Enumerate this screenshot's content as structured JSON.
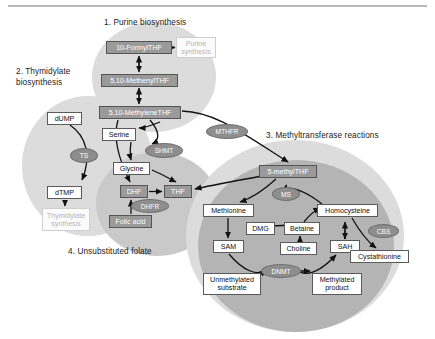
{
  "figure": {
    "sections": [
      {
        "id": "purine",
        "label": "1. Purine biosynthesis",
        "x": 104,
        "y": 18,
        "w": 130
      },
      {
        "id": "thymidylate",
        "label": "2. Thymidylate\nbiosynthesis",
        "x": 16,
        "y": 67,
        "w": 86
      },
      {
        "id": "methyltransferase",
        "label": "3. Methyltransferase reactions",
        "x": 266,
        "y": 131,
        "w": 150
      },
      {
        "id": "unsubstituted",
        "label": "4. Unsubstituted folate",
        "x": 68,
        "y": 247,
        "w": 130
      }
    ],
    "metabolites": [
      {
        "id": "formylthf",
        "label": "10-FormylTHF",
        "style": "gray",
        "x": 106,
        "y": 41,
        "w": 66,
        "h": 13
      },
      {
        "id": "purine-synthesis",
        "label": "Purine\nsynthesis",
        "style": "faded",
        "x": 176,
        "y": 37,
        "w": 40,
        "h": 21
      },
      {
        "id": "methenylthf",
        "label": "5,10-MethenylTHF",
        "style": "gray",
        "x": 101,
        "y": 74,
        "w": 77,
        "h": 13
      },
      {
        "id": "methylenethf",
        "label": "5,10-MethyleneTHF",
        "style": "gray",
        "x": 99,
        "y": 106,
        "w": 82,
        "h": 13
      },
      {
        "id": "dump",
        "label": "dUMP",
        "style": "white",
        "x": 47,
        "y": 112,
        "w": 35,
        "h": 13
      },
      {
        "id": "serine",
        "label": "Serine",
        "style": "white",
        "x": 102,
        "y": 128,
        "w": 34,
        "h": 13
      },
      {
        "id": "glycine",
        "label": "Glycine",
        "style": "white",
        "x": 113,
        "y": 162,
        "w": 37,
        "h": 13
      },
      {
        "id": "dtmp",
        "label": "dTMP",
        "style": "white",
        "x": 47,
        "y": 186,
        "w": 35,
        "h": 13
      },
      {
        "id": "thymidylate-synthesis",
        "label": "Thymidylate\nsynthesis",
        "style": "faded",
        "x": 42,
        "y": 208,
        "w": 48,
        "h": 23
      },
      {
        "id": "dhf",
        "label": "DHF",
        "style": "gray",
        "x": 120,
        "y": 185,
        "w": 28,
        "h": 13
      },
      {
        "id": "thf",
        "label": "THF",
        "style": "gray",
        "x": 164,
        "y": 185,
        "w": 28,
        "h": 13
      },
      {
        "id": "folic-acid",
        "label": "Folic acid",
        "style": "gray",
        "x": 109,
        "y": 215,
        "w": 43,
        "h": 13
      },
      {
        "id": "methylthf",
        "label": "5-methylTHF",
        "style": "gray",
        "x": 259,
        "y": 165,
        "w": 58,
        "h": 13
      },
      {
        "id": "methionine",
        "label": "Methionine",
        "style": "white",
        "x": 203,
        "y": 204,
        "w": 51,
        "h": 13
      },
      {
        "id": "homocysteine",
        "label": "Homocysteine",
        "style": "white",
        "x": 317,
        "y": 204,
        "w": 61,
        "h": 13
      },
      {
        "id": "dmg",
        "label": "DMG",
        "style": "white",
        "x": 246,
        "y": 222,
        "w": 29,
        "h": 13
      },
      {
        "id": "betaine",
        "label": "Betaine",
        "style": "white",
        "x": 284,
        "y": 222,
        "w": 36,
        "h": 13
      },
      {
        "id": "sam",
        "label": "SAM",
        "style": "white",
        "x": 213,
        "y": 240,
        "w": 31,
        "h": 13
      },
      {
        "id": "choline",
        "label": "Choline",
        "style": "white",
        "x": 280,
        "y": 242,
        "w": 37,
        "h": 13
      },
      {
        "id": "sah",
        "label": "SAH",
        "style": "white",
        "x": 330,
        "y": 240,
        "w": 30,
        "h": 13
      },
      {
        "id": "cystathionine",
        "label": "Cystathionine",
        "style": "white",
        "x": 350,
        "y": 250,
        "w": 59,
        "h": 13
      },
      {
        "id": "unmethylated",
        "label": "Unmethylated\nsubstrate",
        "style": "white",
        "x": 203,
        "y": 273,
        "w": 58,
        "h": 22
      },
      {
        "id": "methylated",
        "label": "Methylated\nproduct",
        "style": "white",
        "x": 312,
        "y": 273,
        "w": 50,
        "h": 22
      }
    ],
    "enzymes": [
      {
        "id": "ts",
        "label": "TS",
        "x": 70,
        "y": 148,
        "w": 28,
        "h": 15
      },
      {
        "id": "shmt",
        "label": "SHMT",
        "x": 145,
        "y": 143,
        "w": 38,
        "h": 15
      },
      {
        "id": "dhfr",
        "label": "DHFR",
        "x": 131,
        "y": 199,
        "w": 38,
        "h": 14
      },
      {
        "id": "mthfr",
        "label": "MTHFR",
        "x": 206,
        "y": 124,
        "w": 42,
        "h": 15
      },
      {
        "id": "ms",
        "label": "MS",
        "x": 272,
        "y": 187,
        "w": 28,
        "h": 14
      },
      {
        "id": "cbs",
        "label": "CBS",
        "x": 368,
        "y": 224,
        "w": 31,
        "h": 14
      },
      {
        "id": "dnmt",
        "label": "DNMT",
        "x": 261,
        "y": 264,
        "w": 40,
        "h": 14
      }
    ],
    "colors": {
      "blob_light": "#dcdcdc",
      "blob_mid": "#c9c9c9",
      "blob_dark": "#b4b4b4",
      "node_gray": "#9a9a9a",
      "enzyme": "#8e8e8e",
      "arrow": "#111111",
      "rule": "#b9b9b9"
    }
  }
}
